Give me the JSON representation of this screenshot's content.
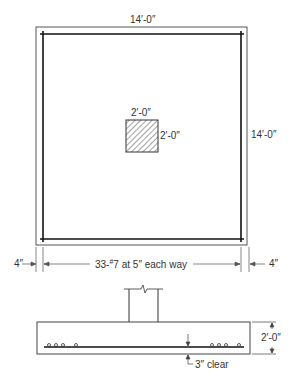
{
  "plan": {
    "top_dimension": "14′-0″",
    "right_dimension": "14′-0″",
    "column": {
      "width_label": "2′-0″",
      "height_label": "2′-0″"
    },
    "left_edge_cover": "4″",
    "right_edge_cover": "4″",
    "reinforcement_label": "33-",
    "bar_size_mark": "#",
    "reinforcement_text": "7 at 5″ each way"
  },
  "section": {
    "depth_label": "2′-0″",
    "clear_cover_label": "3″ clear"
  }
}
